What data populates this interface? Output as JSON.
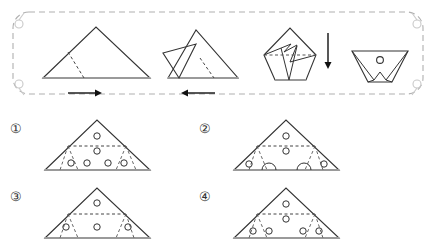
{
  "puzzle": {
    "type": "paper-folding-hole-punch",
    "title": "Paper folding and hole punch reasoning puzzle",
    "band": {
      "frame_style": "dashed rounded rectangle",
      "frame_color": "#b0b0b0",
      "corner_marks": [
        "♁",
        "♁",
        "♁",
        "♁"
      ],
      "steps": [
        {
          "index": 1,
          "name": "unfolded-triangle",
          "description": "Large isosceles triangle with dashed fold crease from left edge to base",
          "arrow": "right-arrow",
          "arrow_glyph": "→"
        },
        {
          "index": 2,
          "name": "left-flap-folded",
          "description": "Triangle with left portion folded inward, dashed crease on right side",
          "arrow": "left-arrow",
          "arrow_glyph": "←"
        },
        {
          "index": 3,
          "name": "both-flaps-folded",
          "description": "Pentagon-like folded shape with horizontal dashed crease across middle",
          "arrow": "down-arrow",
          "arrow_glyph": "↓"
        },
        {
          "index": 4,
          "name": "final-folded-with-hole",
          "description": "Trapezoid final fold with one punched hole near the top center",
          "holes": 1,
          "arrow": "",
          "arrow_glyph": ""
        }
      ]
    },
    "options": [
      {
        "id": "1",
        "label": "①",
        "name": "option-1",
        "center_holes": 2,
        "bottom_holes": 4,
        "description": "Two holes stacked in central band; four holes along lower band; plain base"
      },
      {
        "id": "2",
        "label": "②",
        "name": "option-2",
        "center_holes": 2,
        "bottom_holes": 2,
        "description": "Two holes stacked in central band; two holes at outer lower corners; two semicircular notches on base"
      },
      {
        "id": "3",
        "label": "③",
        "name": "option-3",
        "center_holes": 1,
        "bottom_holes": 3,
        "description": "One hole in the apex region; three holes across lower band"
      },
      {
        "id": "4",
        "label": "④",
        "name": "option-4",
        "center_holes": 2,
        "bottom_holes": 4,
        "description": "Two holes stacked in central band; four holes clustered inward along lower band"
      }
    ],
    "colors": {
      "stroke": "#333333",
      "dashed": "#555555",
      "frame": "#b0b0b0",
      "base_highlight": "#9a9a9a",
      "corner_mark": "#c8c8c8"
    }
  }
}
